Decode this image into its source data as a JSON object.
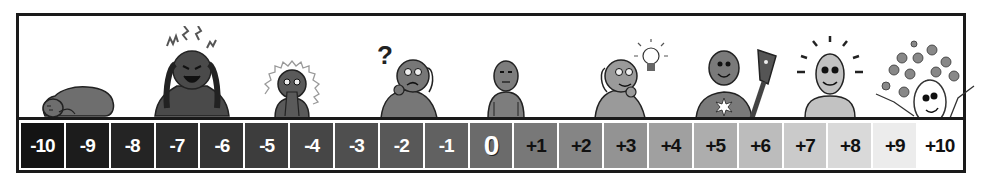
{
  "scale": {
    "cells": [
      {
        "label": "-10",
        "bg": "#141414",
        "fg": "#ffffff"
      },
      {
        "label": "-9",
        "bg": "#1c1c1c",
        "fg": "#ffffff"
      },
      {
        "label": "-8",
        "bg": "#242424",
        "fg": "#ffffff"
      },
      {
        "label": "-7",
        "bg": "#2c2c2c",
        "fg": "#ffffff"
      },
      {
        "label": "-6",
        "bg": "#343434",
        "fg": "#ffffff"
      },
      {
        "label": "-5",
        "bg": "#3d3d3d",
        "fg": "#ffffff"
      },
      {
        "label": "-4",
        "bg": "#464646",
        "fg": "#ffffff"
      },
      {
        "label": "-3",
        "bg": "#4f4f4f",
        "fg": "#ffffff"
      },
      {
        "label": "-2",
        "bg": "#585858",
        "fg": "#ffffff"
      },
      {
        "label": "-1",
        "bg": "#616161",
        "fg": "#ffffff"
      },
      {
        "label": "0",
        "bg": "#6b6b6b",
        "fg": "#ffffff"
      },
      {
        "label": "+1",
        "bg": "#787878",
        "fg": "#111111"
      },
      {
        "label": "+2",
        "bg": "#858585",
        "fg": "#111111"
      },
      {
        "label": "+3",
        "bg": "#939393",
        "fg": "#111111"
      },
      {
        "label": "+4",
        "bg": "#a0a0a0",
        "fg": "#111111"
      },
      {
        "label": "+5",
        "bg": "#adadad",
        "fg": "#111111"
      },
      {
        "label": "+6",
        "bg": "#bcbcbc",
        "fg": "#111111"
      },
      {
        "label": "+7",
        "bg": "#cacaca",
        "fg": "#111111"
      },
      {
        "label": "+8",
        "bg": "#d9d9d9",
        "fg": "#111111"
      },
      {
        "label": "+9",
        "bg": "#ececec",
        "fg": "#111111"
      },
      {
        "label": "+10",
        "bg": "#ffffff",
        "fg": "#111111"
      }
    ]
  },
  "figures": [
    {
      "icon": "curled-up-despair-figure",
      "value": "-10"
    },
    {
      "icon": "screaming-hands-on-head-figure",
      "value": "-8"
    },
    {
      "icon": "shocked-anxious-figure",
      "value": "-5"
    },
    {
      "icon": "confused-question-figure",
      "value": "-3"
    },
    {
      "icon": "neutral-standing-figure",
      "value": "0"
    },
    {
      "icon": "idea-lightbulb-figure",
      "value": "+2"
    },
    {
      "icon": "torch-bearer-star-figure",
      "value": "+4"
    },
    {
      "icon": "radiant-happy-figure",
      "value": "+7"
    },
    {
      "icon": "ecstatic-stars-figure",
      "value": "+9"
    }
  ],
  "glyphs": {
    "question_mark": "?"
  }
}
